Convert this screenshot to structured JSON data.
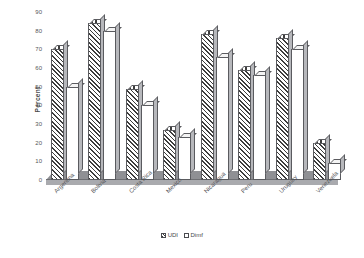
{
  "chart_data": {
    "type": "bar",
    "title": "",
    "xlabel": "",
    "ylabel": "Percent",
    "ylim": [
      0,
      90
    ],
    "ytick_step": 10,
    "yticks": [
      0,
      10,
      20,
      30,
      40,
      50,
      60,
      70,
      80,
      90
    ],
    "grid": false,
    "legend_position": "bottom",
    "categories": [
      "Argentina",
      "Bolivia",
      "Costa Rica",
      "Mexico",
      "Nicaragua",
      "Peru",
      "Uruguay",
      "Venezuela"
    ],
    "series": [
      {
        "name": "UDI",
        "values": [
          70,
          84,
          49,
          27,
          78,
          59,
          76,
          20
        ]
      },
      {
        "name": "Dimf",
        "values": [
          50,
          80,
          40,
          23,
          66,
          56,
          70,
          9
        ]
      }
    ]
  },
  "axis": {
    "y_title": "Percent",
    "y_tick_labels": [
      "90",
      "80",
      "70",
      "60",
      "50",
      "40",
      "30",
      "20",
      "10",
      "0"
    ]
  },
  "legend": {
    "items": [
      {
        "label": "UDI",
        "style": "hatched"
      },
      {
        "label": "Dimf",
        "style": "white"
      }
    ]
  },
  "colors": {
    "hatch": "#3d3d3d",
    "bar_outline": "#5a5b5f",
    "bar_side": "#b7b8bc",
    "floor_top": "#8f9094",
    "floor_front": "#a9aaae",
    "text": "#55565a",
    "background": "#ffffff"
  }
}
